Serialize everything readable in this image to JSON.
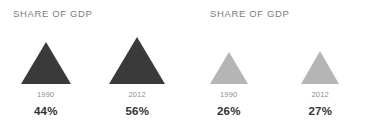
{
  "chart_data": {
    "type": "bar",
    "title": "SHARE OF GDP",
    "xlabel": "",
    "ylabel": "Share of GDP (%)",
    "glyph": "triangle-pictograph",
    "panels": [
      {
        "title": "SHARE OF GDP",
        "color": "#3a3a3a",
        "categories": [
          "1990",
          "2012"
        ],
        "values": [
          44,
          56
        ],
        "value_labels": [
          "44%",
          "56%"
        ]
      },
      {
        "title": "SHARE OF GDP",
        "color": "#b5b5b5",
        "categories": [
          "1990",
          "2012"
        ],
        "values": [
          26,
          27
        ],
        "value_labels": [
          "26%",
          "27%"
        ]
      }
    ],
    "series": [
      {
        "name": "Panel 1",
        "values": [
          44,
          56
        ]
      },
      {
        "name": "Panel 2",
        "values": [
          26,
          27
        ]
      }
    ],
    "categories": [
      "1990",
      "2012"
    ],
    "legend": [],
    "grid": false
  },
  "panels": [
    {
      "title": "SHARE OF GDP",
      "groups": [
        {
          "year": "1990",
          "value": "44%",
          "tri_width": 50,
          "tri_height": 42,
          "color": "#3a3a3a"
        },
        {
          "year": "2012",
          "value": "56%",
          "tri_width": 56,
          "tri_height": 47,
          "color": "#3a3a3a"
        }
      ]
    },
    {
      "title": "SHARE OF GDP",
      "groups": [
        {
          "year": "1990",
          "value": "26%",
          "tri_width": 38,
          "tri_height": 32,
          "color": "#b5b5b5"
        },
        {
          "year": "2012",
          "value": "27%",
          "tri_width": 39,
          "tri_height": 33,
          "color": "#b5b5b5"
        }
      ]
    }
  ]
}
